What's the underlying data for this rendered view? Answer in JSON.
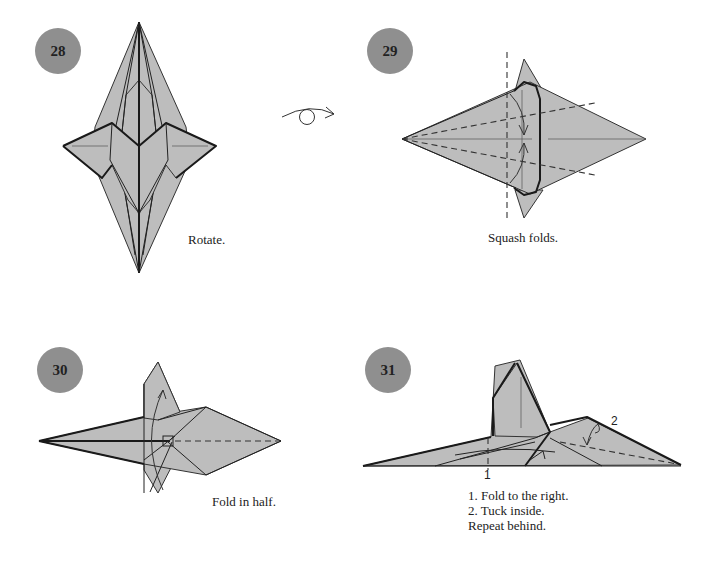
{
  "steps": [
    {
      "number": "28",
      "caption": "Rotate."
    },
    {
      "number": "29",
      "caption": "Squash folds."
    },
    {
      "number": "30",
      "caption": "Fold in half."
    },
    {
      "number": "31",
      "caption_lines": [
        "1. Fold to the right.",
        "2. Tuck inside.",
        "Repeat behind."
      ],
      "labels": [
        "1",
        "2"
      ]
    }
  ],
  "symbols": {
    "rotate": "rotate-arrow"
  },
  "colors": {
    "badge": "#8f8f8f",
    "paper": "#bdbdbd",
    "line": "#222222"
  }
}
